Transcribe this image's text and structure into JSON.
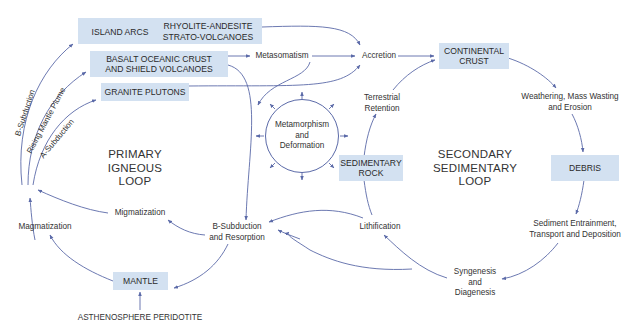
{
  "diagram": {
    "boxes": {
      "island_arcs": "ISLAND ARCS",
      "rhyolite": "RHYOLITE-ANDESITE\nSTRATO-VOLCANOES",
      "basalt": "BASALT OCEANIC CRUST\nAND SHIELD VOLCANOES",
      "granite": "GRANITE PLUTONS",
      "continental": "CONTINENTAL\nCRUST",
      "debris": "DEBRIS",
      "sedimentary_rock": "SEDIMENTARY\nROCK",
      "mantle": "MANTLE"
    },
    "labels": {
      "metasomatism": "Metasomatism",
      "accretion": "Accretion",
      "terrestrial_retention": "Terrestrial\nRetention",
      "weathering": "Weathering, Mass Wasting\nand Erosion",
      "metamorphism": "Metamorphism\nand\nDeformation",
      "sediment_entrainment": "Sediment Entrainment,\nTransport and Deposition",
      "lithification": "Lithification",
      "syngenesis": "Syngenesis\nand\nDiagenesis",
      "b_subduction_resorption": "B-Subduction\nand Resorption",
      "migmatization": "Migmatization",
      "magmatization": "Magmatization",
      "asthenosphere": "ASTHENOSPHERE PERIDOTITE",
      "b_subduction": "B-Subduction",
      "rising_mantle_plume": "Rising Mantle Plume",
      "a_subduction": "A-Subduction"
    },
    "loops": {
      "primary": "PRIMARY\nIGNEOUS\nLOOP",
      "secondary": "SECONDARY\nSEDIMENTARY\nLOOP"
    },
    "colors": {
      "box_fill": "#d3e1f1",
      "arrow": "#5b6aa8",
      "text": "#333333"
    }
  }
}
